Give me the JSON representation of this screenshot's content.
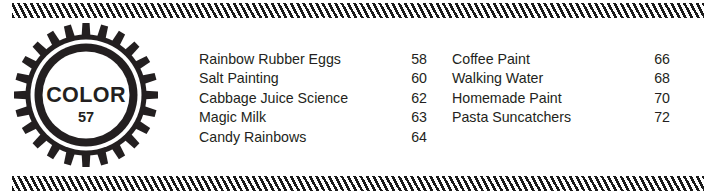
{
  "document": {
    "section_badge": {
      "label": "COLOR",
      "number": "57",
      "icon": "gear-seal-icon"
    },
    "rules": {
      "top": "diagonal-hatch-rule",
      "bottom": "diagonal-hatch-rule"
    },
    "contents": {
      "left_column": [
        {
          "title": "Rainbow Rubber Eggs",
          "page": "58"
        },
        {
          "title": "Salt Painting",
          "page": "60"
        },
        {
          "title": "Cabbage Juice Science",
          "page": "62"
        },
        {
          "title": "Magic Milk",
          "page": "63"
        },
        {
          "title": "Candy Rainbows",
          "page": "64"
        }
      ],
      "right_column": [
        {
          "title": "Coffee Paint",
          "page": "66"
        },
        {
          "title": "Walking Water",
          "page": "68"
        },
        {
          "title": "Homemade Paint",
          "page": "70"
        },
        {
          "title": "Pasta Suncatchers",
          "page": "72"
        }
      ]
    },
    "colors": {
      "ink": "#231f20",
      "hatch": "#1a1a1a",
      "paper": "#ffffff"
    }
  }
}
